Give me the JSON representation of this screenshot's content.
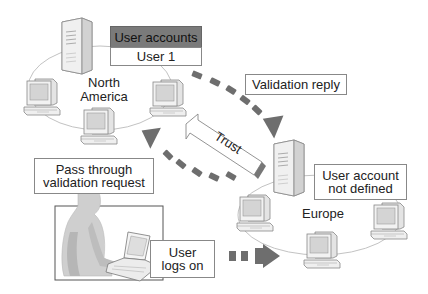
{
  "diagram": {
    "title": "",
    "regions": [
      {
        "id": "north-america",
        "label_line1": "North",
        "label_line2": "America"
      },
      {
        "id": "europe",
        "label": "Europe"
      }
    ],
    "callouts": {
      "user_accounts_header": "User accounts",
      "user_accounts_row": "User 1",
      "validation_reply": "Validation reply",
      "pass_through_line1": "Pass through",
      "pass_through_line2": "validation request",
      "user_logs_on_line1": "User",
      "user_logs_on_line2": "logs on",
      "user_account_not_defined_line1": "User account",
      "user_account_not_defined_line2": "not defined"
    },
    "arrows": {
      "trust_label": "Trust"
    },
    "colors": {
      "arrow_dark": "#6e6e6e",
      "box_header": "#7a7a7a",
      "outline": "#8a8a8a",
      "computer_fill": "#ededed",
      "screen_fill": "#d6d6d6"
    }
  }
}
